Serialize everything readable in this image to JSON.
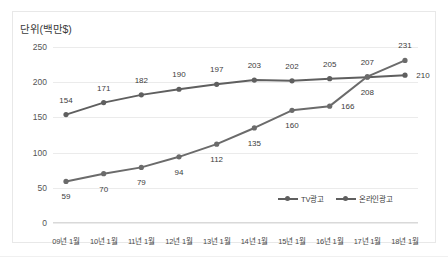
{
  "chart_data": {
    "type": "line",
    "title": "단위(백만$)",
    "xlabel": "",
    "ylabel": "단위(백만$)",
    "ylim": [
      0,
      250
    ],
    "yticks": [
      0,
      50,
      100,
      150,
      200,
      250
    ],
    "grid": true,
    "legend_position": "inside-bottom-right",
    "categories": [
      "09년 1월",
      "10년 1월",
      "11년 1월",
      "12년 1월",
      "13년 1월",
      "14년 1월",
      "15년 1월",
      "16년 1월",
      "17년 1월",
      "18년 1월"
    ],
    "series": [
      {
        "name": "TV광고",
        "color": "#5f5f5f",
        "values": [
          154,
          171,
          182,
          190,
          197,
          203,
          202,
          205,
          207,
          210
        ],
        "label_positions": [
          "above",
          "above",
          "above",
          "above",
          "above",
          "above",
          "above",
          "above",
          "above",
          "right"
        ]
      },
      {
        "name": "온라인광고",
        "color": "#6b6b6b",
        "values": [
          59,
          70,
          79,
          94,
          112,
          135,
          160,
          166,
          208,
          231
        ],
        "label_positions": [
          "below",
          "below",
          "below",
          "below",
          "below",
          "below",
          "below",
          "right",
          "below",
          "above"
        ]
      }
    ]
  },
  "legend": {
    "items": [
      {
        "label": "TV광고"
      },
      {
        "label": "온라인광고"
      }
    ]
  }
}
